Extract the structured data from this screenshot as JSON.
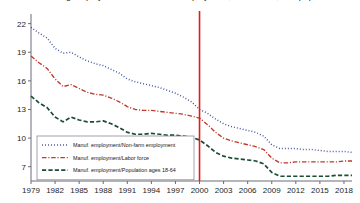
{
  "chart_data": {
    "type": "line",
    "title": "Manufacturing employment as a share of employment, labor force, and population",
    "xlabel": "",
    "ylabel": "",
    "xlim": [
      1979,
      2019
    ],
    "ylim": [
      5.5,
      22.8
    ],
    "xticks": [
      1979,
      1982,
      1985,
      1988,
      1991,
      1994,
      1997,
      2000,
      2003,
      2006,
      2009,
      2012,
      2015,
      2018
    ],
    "yticks": [
      7,
      10,
      13,
      16,
      19,
      22
    ],
    "grid": false,
    "legend_position": "lower-left",
    "annotations": [
      {
        "type": "vline",
        "x": 2000,
        "color": "#e01b1b",
        "label": "2000"
      }
    ],
    "x": [
      1979,
      1980,
      1981,
      1982,
      1983,
      1984,
      1985,
      1986,
      1987,
      1988,
      1989,
      1990,
      1991,
      1992,
      1993,
      1994,
      1995,
      1996,
      1997,
      1998,
      1999,
      2000,
      2001,
      2002,
      2003,
      2004,
      2005,
      2006,
      2007,
      2008,
      2009,
      2010,
      2011,
      2012,
      2013,
      2014,
      2015,
      2016,
      2017,
      2018,
      2019
    ],
    "series": [
      {
        "name": "Manuf. employment/Non-farm employment",
        "color": "#3b4a9c",
        "style": "dotted",
        "values": [
          21.6,
          21.0,
          20.5,
          19.4,
          18.9,
          19.0,
          18.5,
          18.1,
          17.8,
          17.6,
          17.2,
          16.8,
          16.2,
          15.9,
          15.7,
          15.5,
          15.3,
          15.0,
          14.7,
          14.3,
          13.8,
          13.0,
          12.6,
          12.0,
          11.5,
          11.2,
          11.0,
          10.8,
          10.6,
          10.2,
          9.3,
          8.9,
          8.9,
          8.9,
          8.8,
          8.8,
          8.7,
          8.6,
          8.6,
          8.6,
          8.5
        ]
      },
      {
        "name": "Manuf. employment/Labor force",
        "color": "#c0392b",
        "style": "dashdot",
        "values": [
          18.6,
          17.9,
          17.3,
          16.2,
          15.4,
          15.6,
          15.2,
          14.8,
          14.6,
          14.5,
          14.2,
          13.8,
          13.3,
          13.0,
          12.9,
          12.9,
          12.8,
          12.7,
          12.6,
          12.5,
          12.3,
          12.1,
          11.4,
          10.6,
          10.0,
          9.7,
          9.5,
          9.3,
          9.1,
          8.8,
          7.9,
          7.4,
          7.4,
          7.5,
          7.5,
          7.5,
          7.5,
          7.5,
          7.5,
          7.6,
          7.6
        ]
      },
      {
        "name": "Manuf. employment/Population ages 18-64",
        "color": "#1d4b33",
        "style": "dashed",
        "values": [
          14.4,
          13.7,
          13.2,
          12.2,
          11.7,
          12.2,
          11.9,
          11.7,
          11.7,
          11.8,
          11.5,
          11.1,
          10.6,
          10.4,
          10.4,
          10.5,
          10.4,
          10.3,
          10.3,
          10.2,
          10.1,
          9.8,
          9.2,
          8.5,
          8.1,
          7.9,
          7.8,
          7.7,
          7.6,
          7.3,
          6.4,
          6.0,
          6.0,
          6.0,
          6.0,
          6.0,
          6.0,
          6.0,
          6.1,
          6.1,
          6.1
        ]
      }
    ]
  }
}
